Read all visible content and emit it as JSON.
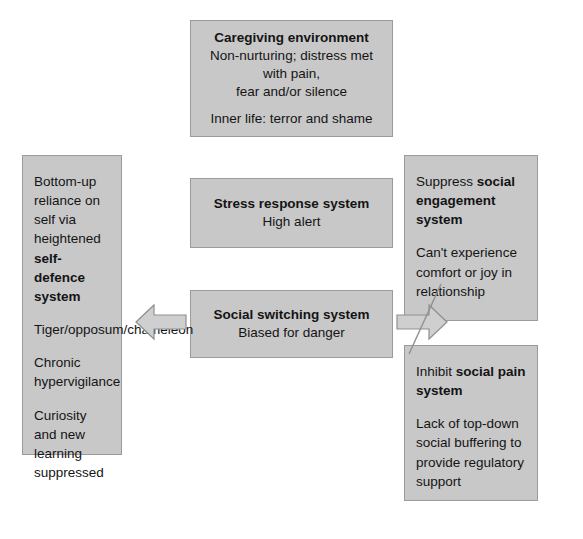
{
  "diagram": {
    "type": "flow-diagram",
    "colors": {
      "box_fill": "#c8c8c8",
      "box_border": "#9b9b9b",
      "text": "#141414",
      "arrow_fill": "#cfcfcf",
      "arrow_stroke": "#8f8f8f",
      "background": "#ffffff"
    },
    "boxes": {
      "caregiving": {
        "heading": "Caregiving environment",
        "line1": "Non-nurturing; distress met with pain,",
        "line2": "fear and/or silence",
        "line3": "Inner life: terror and shame"
      },
      "stress": {
        "heading": "Stress response system",
        "subtitle": "High alert"
      },
      "switching": {
        "heading": "Social switching system",
        "subtitle": "Biased for danger"
      },
      "self_defence": {
        "p1_plain": "Bottom-up reliance on self via heightened ",
        "p1_bold": "self-defence system",
        "p2": "Tiger/opposum/chameleon",
        "p3": "Chronic hypervigilance",
        "p4": "Curiosity and new learning suppressed"
      },
      "engagement": {
        "p1_plain": "Suppress ",
        "p1_bold": "social engagement system",
        "p2": "Can't experience comfort or joy in relationship"
      },
      "pain": {
        "p1_plain": "Inhibit ",
        "p1_bold": "social pain system",
        "p2": "Lack of top-down social buffering to provide regulatory support"
      }
    },
    "arrows": {
      "left": {
        "icon": "arrow-left-block",
        "direction": "left",
        "from": "switching",
        "to": "self_defence"
      },
      "right": {
        "icon": "arrow-right-block",
        "direction": "right",
        "from": "switching",
        "to": "engagement-and-pain",
        "annotation": "strike-through-line"
      }
    }
  }
}
